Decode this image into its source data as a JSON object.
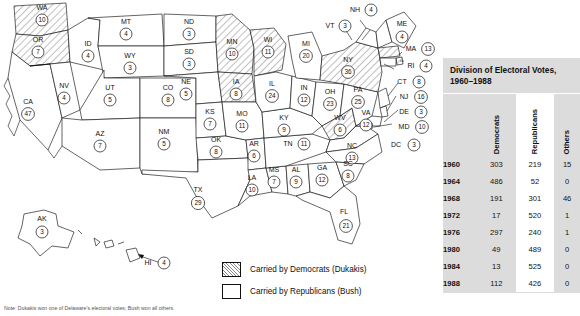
{
  "map": {
    "name": "united-states-electoral-map-1988",
    "states": [
      {
        "abbr": "WA",
        "votes": 10,
        "party": "dem"
      },
      {
        "abbr": "OR",
        "votes": 7,
        "party": "dem"
      },
      {
        "abbr": "CA",
        "votes": 47,
        "party": "rep"
      },
      {
        "abbr": "NV",
        "votes": 4,
        "party": "rep"
      },
      {
        "abbr": "ID",
        "votes": 4,
        "party": "rep"
      },
      {
        "abbr": "MT",
        "votes": 4,
        "party": "rep"
      },
      {
        "abbr": "WY",
        "votes": 3,
        "party": "rep"
      },
      {
        "abbr": "UT",
        "votes": 5,
        "party": "rep"
      },
      {
        "abbr": "AZ",
        "votes": 7,
        "party": "rep"
      },
      {
        "abbr": "CO",
        "votes": 8,
        "party": "rep"
      },
      {
        "abbr": "NM",
        "votes": 5,
        "party": "rep"
      },
      {
        "abbr": "ND",
        "votes": 3,
        "party": "rep"
      },
      {
        "abbr": "SD",
        "votes": 3,
        "party": "rep"
      },
      {
        "abbr": "NE",
        "votes": 5,
        "party": "rep"
      },
      {
        "abbr": "KS",
        "votes": 7,
        "party": "rep"
      },
      {
        "abbr": "OK",
        "votes": 8,
        "party": "rep"
      },
      {
        "abbr": "TX",
        "votes": 29,
        "party": "rep"
      },
      {
        "abbr": "MN",
        "votes": 10,
        "party": "dem"
      },
      {
        "abbr": "IA",
        "votes": 8,
        "party": "dem"
      },
      {
        "abbr": "WI",
        "votes": 11,
        "party": "dem"
      },
      {
        "abbr": "MO",
        "votes": 11,
        "party": "rep"
      },
      {
        "abbr": "AR",
        "votes": 6,
        "party": "rep"
      },
      {
        "abbr": "LA",
        "votes": 10,
        "party": "rep"
      },
      {
        "abbr": "MS",
        "votes": 7,
        "party": "rep"
      },
      {
        "abbr": "AL",
        "votes": 9,
        "party": "rep"
      },
      {
        "abbr": "GA",
        "votes": 12,
        "party": "rep"
      },
      {
        "abbr": "FL",
        "votes": 21,
        "party": "rep"
      },
      {
        "abbr": "TN",
        "votes": 11,
        "party": "rep"
      },
      {
        "abbr": "KY",
        "votes": 9,
        "party": "rep"
      },
      {
        "abbr": "IL",
        "votes": 24,
        "party": "rep"
      },
      {
        "abbr": "IN",
        "votes": 12,
        "party": "rep"
      },
      {
        "abbr": "MI",
        "votes": 20,
        "party": "rep"
      },
      {
        "abbr": "OH",
        "votes": 23,
        "party": "rep"
      },
      {
        "abbr": "WV",
        "votes": 6,
        "party": "dem"
      },
      {
        "abbr": "VA",
        "votes": 12,
        "party": "rep"
      },
      {
        "abbr": "NC",
        "votes": 13,
        "party": "rep"
      },
      {
        "abbr": "SC",
        "votes": 8,
        "party": "rep"
      },
      {
        "abbr": "PA",
        "votes": 25,
        "party": "rep"
      },
      {
        "abbr": "NY",
        "votes": 36,
        "party": "dem"
      },
      {
        "abbr": "VT",
        "votes": 3,
        "party": "rep"
      },
      {
        "abbr": "NH",
        "votes": 4,
        "party": "rep"
      },
      {
        "abbr": "ME",
        "votes": 4,
        "party": "rep"
      },
      {
        "abbr": "MA",
        "votes": 13,
        "party": "dem"
      },
      {
        "abbr": "RI",
        "votes": 4,
        "party": "dem"
      },
      {
        "abbr": "CT",
        "votes": 8,
        "party": "rep"
      },
      {
        "abbr": "NJ",
        "votes": 16,
        "party": "rep"
      },
      {
        "abbr": "DE",
        "votes": 3,
        "party": "rep"
      },
      {
        "abbr": "MD",
        "votes": 10,
        "party": "rep"
      },
      {
        "abbr": "DC",
        "votes": 3,
        "party": "dem"
      },
      {
        "abbr": "AK",
        "votes": 3,
        "party": "rep"
      },
      {
        "abbr": "HI",
        "votes": 4,
        "party": "dem"
      }
    ]
  },
  "legend": {
    "items": [
      {
        "swatch": "hatched",
        "label": "Carried by Democrats (Dukakis)"
      },
      {
        "swatch": "white",
        "label": "Carried by Republicans (Bush)"
      }
    ]
  },
  "table": {
    "title": "Division of Electoral Votes, 1960–1988",
    "columns": [
      "",
      "Democrats",
      "Republicans",
      "Others"
    ],
    "rows": [
      {
        "year": "1960",
        "dem": "303",
        "rep": "219",
        "oth": "15"
      },
      {
        "year": "1964",
        "dem": "486",
        "rep": "52",
        "oth": "0"
      },
      {
        "year": "1968",
        "dem": "191",
        "rep": "301",
        "oth": "46"
      },
      {
        "year": "1972",
        "dem": "17",
        "rep": "520",
        "oth": "1"
      },
      {
        "year": "1976",
        "dem": "297",
        "rep": "240",
        "oth": "1"
      },
      {
        "year": "1980",
        "dem": "49",
        "rep": "489",
        "oth": "0"
      },
      {
        "year": "1984",
        "dem": "13",
        "rep": "525",
        "oth": "0"
      },
      {
        "year": "1988",
        "dem": "112",
        "rep": "426",
        "oth": "0"
      }
    ]
  },
  "footnote": {
    "text": "Note: Dukakis won one of Delaware's electoral votes; Bush won all others."
  },
  "colors": {
    "panel_background": "#dcdcdc",
    "republican_column": "#ffffff",
    "outline": "#111111",
    "hatch": "#888888"
  }
}
